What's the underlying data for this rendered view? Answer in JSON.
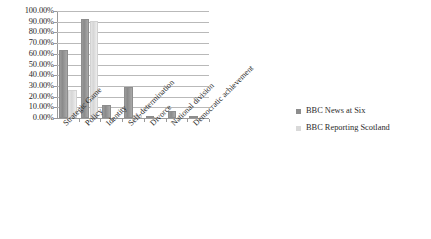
{
  "chart_data": {
    "type": "bar",
    "title": "",
    "subtitle": "",
    "xlabel": "",
    "ylabel": "",
    "ylim": [
      0,
      100
    ],
    "ytick_labels": [
      "0.00%",
      "10.00%",
      "20.00%",
      "30.00%",
      "40.00%",
      "50.00%",
      "60.00%",
      "70.00%",
      "80.00%",
      "90.00%",
      "100.00%"
    ],
    "ytick_values": [
      0,
      10,
      20,
      30,
      40,
      50,
      60,
      70,
      80,
      90,
      100
    ],
    "grid": true,
    "legend_position": "right",
    "categories": [
      "Strategic Game",
      "Policy",
      "Identity",
      "Self-determination",
      "Divorce",
      "National division",
      "Democratic achievement"
    ],
    "series": [
      {
        "name": "BBC News at Six",
        "color": "#8d8d8d",
        "values": [
          64,
          93,
          12,
          29,
          1,
          7,
          1
        ]
      },
      {
        "name": "BBC Reporting Scotland",
        "color": "#d9d9d9",
        "values": [
          26,
          91,
          0,
          3,
          0,
          0,
          0
        ]
      }
    ]
  },
  "legend": {
    "items": [
      {
        "label": "BBC News at Six"
      },
      {
        "label": "BBC Reporting Scotland"
      }
    ]
  }
}
